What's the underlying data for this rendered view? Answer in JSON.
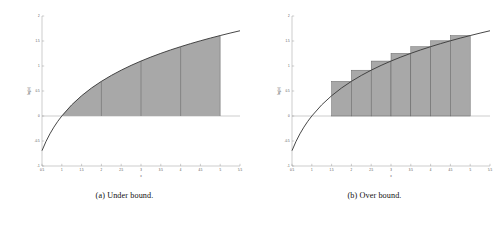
{
  "figure": {
    "panels": [
      {
        "id": "under-bound",
        "caption": "(a) Under bound.",
        "chart_data": {
          "type": "area",
          "title": "",
          "xlabel": "x",
          "ylabel": "log(x)",
          "xlim": [
            0.5,
            5.5
          ],
          "ylim": [
            -1,
            2
          ],
          "grid": false,
          "legend": "none",
          "curve": {
            "name": "log(x)",
            "x": [
              0.5,
              0.6,
              0.7,
              0.8,
              0.9,
              1.0,
              1.25,
              1.5,
              1.75,
              2.0,
              2.25,
              2.5,
              2.75,
              3.0,
              3.25,
              3.5,
              3.75,
              4.0,
              4.25,
              4.5,
              4.75,
              5.0,
              5.25,
              5.5
            ],
            "y": [
              -0.693,
              -0.511,
              -0.357,
              -0.223,
              -0.105,
              0.0,
              0.223,
              0.405,
              0.56,
              0.693,
              0.811,
              0.916,
              1.012,
              1.099,
              1.179,
              1.253,
              1.322,
              1.386,
              1.447,
              1.504,
              1.558,
              1.609,
              1.658,
              1.705
            ]
          },
          "shaded_region": {
            "label": "area under log(x)",
            "x_start": 1.0,
            "x_end": 5.0,
            "fill": "#a8a8a8",
            "top_edge": "curve"
          },
          "dividers": {
            "label": "partition lines",
            "x": [
              2,
              3,
              4
            ]
          },
          "xticks": [
            0.5,
            1,
            1.5,
            2,
            2.5,
            3,
            3.5,
            4,
            4.5,
            5,
            5.5
          ],
          "xtick_labels": [
            "0.5",
            "1",
            "1.5",
            "2",
            "2.5",
            "3",
            "3.5",
            "4",
            "4.5",
            "5",
            "5.5"
          ],
          "yticks": [
            -1,
            -0.5,
            0,
            0.5,
            1,
            1.5,
            2
          ],
          "ytick_labels": [
            "-1",
            "-0.5",
            "0",
            "0.5",
            "1",
            "1.5",
            "2"
          ]
        }
      },
      {
        "id": "over-bound",
        "caption": "(b) Over bound.",
        "chart_data": {
          "type": "bar",
          "title": "",
          "xlabel": "x",
          "ylabel": "log(x)",
          "xlim": [
            0.5,
            5.5
          ],
          "ylim": [
            -1,
            2
          ],
          "grid": false,
          "legend": "none",
          "curve": {
            "name": "log(x)",
            "x": [
              0.5,
              0.6,
              0.7,
              0.8,
              0.9,
              1.0,
              1.25,
              1.5,
              1.75,
              2.0,
              2.25,
              2.5,
              2.75,
              3.0,
              3.25,
              3.5,
              3.75,
              4.0,
              4.25,
              4.5,
              4.75,
              5.0,
              5.25,
              5.5
            ],
            "y": [
              -0.693,
              -0.511,
              -0.357,
              -0.223,
              -0.105,
              0.0,
              0.223,
              0.405,
              0.56,
              0.693,
              0.811,
              0.916,
              1.012,
              1.099,
              1.179,
              1.253,
              1.322,
              1.386,
              1.447,
              1.504,
              1.558,
              1.609,
              1.658,
              1.705
            ]
          },
          "bars": {
            "label": "upper Riemann rectangles",
            "width": 0.5,
            "fill": "#a8a8a8",
            "x_left": [
              1.5,
              2.0,
              2.5,
              3.0,
              3.5,
              4.0,
              4.5
            ],
            "x_right": [
              2.0,
              2.5,
              3.0,
              3.5,
              4.0,
              4.5,
              5.0
            ],
            "heights": [
              0.693,
              0.916,
              1.099,
              1.253,
              1.386,
              1.504,
              1.609
            ]
          },
          "xticks": [
            0.5,
            1,
            1.5,
            2,
            2.5,
            3,
            3.5,
            4,
            4.5,
            5,
            5.5
          ],
          "xtick_labels": [
            "0.5",
            "1",
            "1.5",
            "2",
            "2.5",
            "3",
            "3.5",
            "4",
            "4.5",
            "5",
            "5.5"
          ],
          "yticks": [
            -1,
            -0.5,
            0,
            0.5,
            1,
            1.5,
            2
          ],
          "ytick_labels": [
            "-1",
            "-0.5",
            "0",
            "0.5",
            "1",
            "1.5",
            "2"
          ]
        }
      }
    ]
  }
}
